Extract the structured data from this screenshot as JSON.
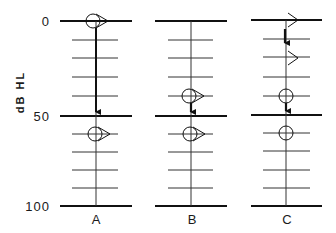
{
  "figure": {
    "type": "audiogram-masking-diagram",
    "y_axis": {
      "label": "dB HL",
      "ticks": [
        {
          "value": 0,
          "label": "0"
        },
        {
          "value": 50,
          "label": "50"
        },
        {
          "value": 100,
          "label": "100"
        }
      ],
      "range": [
        0,
        100
      ],
      "minor_step_dB": 10
    },
    "panels": [
      {
        "label": "A",
        "symbols": [
          {
            "type": "circle-with-right-triangle",
            "level_dB": 0,
            "meaning": "air conduction with masking indicator"
          },
          {
            "type": "circle-with-right-triangle",
            "level_dB": 60
          }
        ],
        "arrows": [
          {
            "from_dB": 0,
            "to_dB": 50,
            "weight": "bold"
          }
        ]
      },
      {
        "label": "B",
        "symbols": [
          {
            "type": "circle-with-right-triangle",
            "level_dB": 40
          },
          {
            "type": "circle-with-right-triangle",
            "level_dB": 60
          }
        ],
        "arrows": [
          {
            "from_dB": 40,
            "to_dB": 50,
            "weight": "bold"
          }
        ]
      },
      {
        "label": "C",
        "symbols": [
          {
            "type": "open-chevron-right",
            "level_dB": 0
          },
          {
            "type": "open-chevron-right",
            "level_dB": 20
          },
          {
            "type": "circle",
            "level_dB": 40
          },
          {
            "type": "circle",
            "level_dB": 60
          }
        ],
        "arrows": [
          {
            "from_dB": 0,
            "to_dB": 10,
            "weight": "bold"
          },
          {
            "from_dB": 40,
            "to_dB": 50,
            "weight": "bold"
          }
        ]
      }
    ]
  }
}
